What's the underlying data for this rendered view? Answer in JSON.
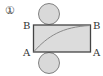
{
  "figure": {
    "number_label": "①",
    "labels": {
      "top_left": "B",
      "top_right": "B",
      "bottom_left": "A",
      "bottom_right": "A"
    },
    "colors": {
      "fill": "#d9d9d9",
      "stroke": "#444444",
      "curve": "#8a8a8a",
      "text": "#333333"
    }
  }
}
